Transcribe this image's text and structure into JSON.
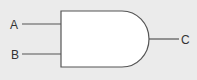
{
  "diagram": {
    "type": "logic-gate",
    "gate": "AND",
    "inputs": [
      {
        "label": "A"
      },
      {
        "label": "B"
      }
    ],
    "output": {
      "label": "C"
    },
    "colors": {
      "background": "#ebebeb",
      "gate_fill": "#ffffff",
      "stroke": "#555555",
      "text": "#333333"
    }
  }
}
